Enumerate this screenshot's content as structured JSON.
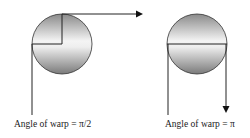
{
  "diagram": {
    "panels": [
      {
        "id": "left",
        "label": "Angle of warp = π/2"
      },
      {
        "id": "right",
        "label": "Angle of warp = π"
      }
    ],
    "colors": {
      "line": "#222222",
      "sphere_light": "#ffffff",
      "sphere_dark": "#808080"
    }
  }
}
